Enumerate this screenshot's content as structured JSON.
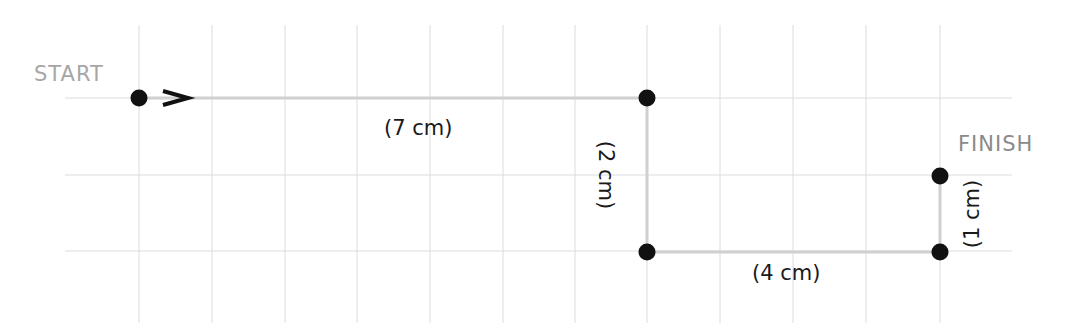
{
  "diagram": {
    "grid": {
      "cell_px": 72.8,
      "x_lines": [
        139,
        212,
        285,
        357,
        430,
        503,
        575,
        647,
        720,
        793,
        866,
        940
      ],
      "y_lines": [
        98,
        175,
        251
      ],
      "x_range": [
        65,
        1012
      ],
      "y_range": [
        25,
        323
      ],
      "color": "#dcdcdc"
    },
    "path_color": "#d0d0d0",
    "point_color": "#111111",
    "points": [
      {
        "name": "start",
        "x": 139,
        "y": 98
      },
      {
        "name": "corner-1",
        "x": 647,
        "y": 98
      },
      {
        "name": "corner-2",
        "x": 647,
        "y": 252
      },
      {
        "name": "corner-3",
        "x": 940,
        "y": 252
      },
      {
        "name": "finish",
        "x": 940,
        "y": 176
      }
    ],
    "labels": {
      "start": "START",
      "finish": "FINISH",
      "seg1": "(7 cm)",
      "seg2": "(2 cm)",
      "seg3": "(4 cm)",
      "seg4": "(1 cm)"
    },
    "arrow": "direction-right"
  }
}
